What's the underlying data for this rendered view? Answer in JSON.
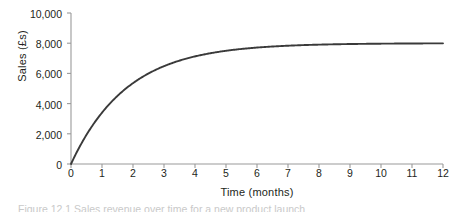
{
  "chart_data": {
    "type": "line",
    "title": "",
    "xlabel": "Time (months)",
    "ylabel": "Sales (£s)",
    "xlim": [
      0,
      12
    ],
    "ylim": [
      0,
      10000
    ],
    "grid": false,
    "legend": null,
    "x_ticks": [
      "0",
      "1",
      "2",
      "3",
      "4",
      "5",
      "6",
      "7",
      "8",
      "9",
      "10",
      "11",
      "12"
    ],
    "y_ticks": [
      "0",
      "2,000",
      "4,000",
      "6,000",
      "8,000",
      "10,000"
    ],
    "x": [
      0,
      1,
      2,
      3,
      4,
      5,
      6,
      7,
      8,
      9,
      10,
      11,
      12
    ],
    "series": [
      {
        "name": "Sales",
        "color": "#3a3a3a",
        "asymptote": 8000,
        "values": [
          0,
          3400,
          5500,
          6800,
          7450,
          7800,
          7950,
          7980,
          7990,
          7995,
          7998,
          7999,
          8000
        ]
      }
    ],
    "annotations": []
  },
  "axis": {
    "line_color": "#9a9a9a",
    "tick_color": "#9a9a9a"
  },
  "caption": {
    "text": "Figure 12.1  Sales revenue over time for a new product launch"
  }
}
